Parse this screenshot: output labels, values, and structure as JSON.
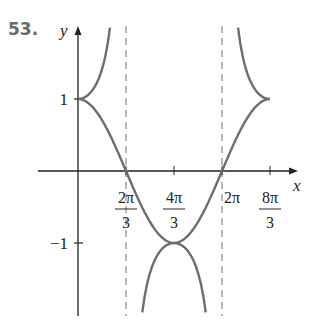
{
  "problem_number": "53.",
  "chart_data": {
    "type": "line",
    "title": "",
    "xlabel": "x",
    "ylabel": "y",
    "x_ticks": [
      "2π/3",
      "4π/3",
      "2π",
      "8π/3"
    ],
    "x_tick_values": [
      2.0944,
      4.1888,
      6.2832,
      8.3776
    ],
    "y_ticks": [
      "1",
      "-1"
    ],
    "y_tick_values": [
      1,
      -1
    ],
    "xlim": [
      0,
      8.3776
    ],
    "ylim": [
      -2,
      2
    ],
    "grid": false,
    "legend": null,
    "asymptotes": [
      {
        "type": "vertical",
        "x": 2.0944,
        "label": "x = 2π/3",
        "style": "dashed"
      },
      {
        "type": "vertical",
        "x": 6.2832,
        "label": "x = 2π",
        "style": "dashed"
      }
    ],
    "series": [
      {
        "name": "y = cos(3x/4)",
        "x": [
          0,
          1.0472,
          2.0944,
          3.1416,
          4.1888,
          5.236,
          6.2832,
          7.3304,
          8.3776
        ],
        "values": [
          1,
          0.707,
          0,
          -0.707,
          -1,
          -0.707,
          0,
          0.707,
          1
        ]
      },
      {
        "name": "y = sec(3x/4)",
        "x": [
          0,
          0.5236,
          1.0472,
          1.5708,
          3.1416,
          4.1888,
          5.236,
          6.7468,
          7.3304,
          7.854,
          8.3776
        ],
        "values": [
          1,
          1.082,
          1.414,
          2.613,
          -1.414,
          -1,
          -1.414,
          2.613,
          1.414,
          1.082,
          1
        ]
      }
    ],
    "colors": {
      "curve": "#6e6e6e",
      "axis": "#222222",
      "asymptote": "#8a8a8a"
    }
  }
}
